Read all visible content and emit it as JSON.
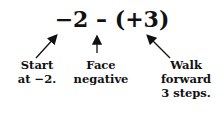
{
  "expression": "−2 – (+3)",
  "labels": [
    {
      "line1": "Start",
      "line2": "at −2."
    },
    {
      "line1": "Face",
      "line2": "negative"
    },
    {
      "line1": "Walk",
      "line2": "forward",
      "line3": "3 steps."
    }
  ]
}
